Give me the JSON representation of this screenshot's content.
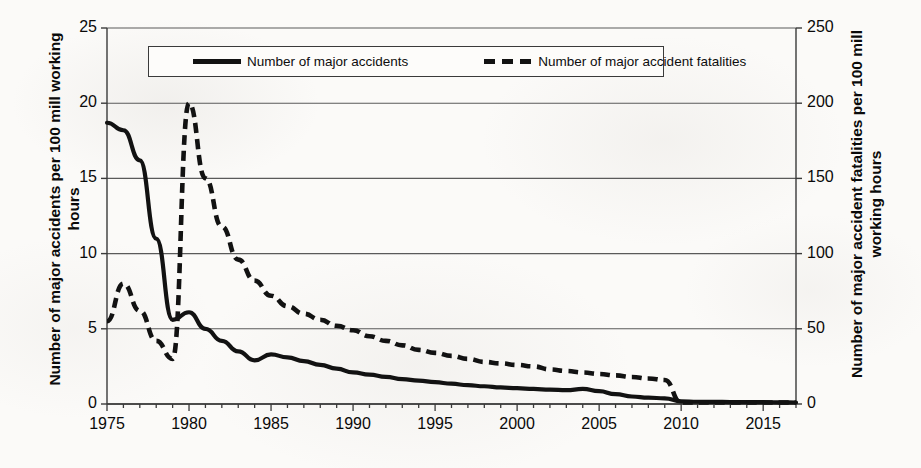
{
  "chart_data": {
    "type": "line",
    "title": "",
    "xlabel": "",
    "ylabel": "Number of major accidents per 100 mill working hours",
    "ylabel_right": "Number of major accident fatalities per 100 mill working hours",
    "xlim": [
      1975,
      2017
    ],
    "ylim": [
      0,
      25
    ],
    "ylim_right": [
      0,
      250
    ],
    "grid": true,
    "legend_position": "top-center",
    "x_ticks": [
      1975,
      1980,
      1985,
      1990,
      1995,
      2000,
      2005,
      2010,
      2015
    ],
    "x_tick_labels": [
      "1975",
      "1980",
      "1985",
      "1990",
      "1995",
      "2000",
      "2005",
      "2010",
      "2015"
    ],
    "x_minor_tick_step": 1,
    "y_ticks_left": [
      0,
      5,
      10,
      15,
      20,
      25
    ],
    "y_tick_labels_left": [
      "0",
      "5",
      "10",
      "15",
      "20",
      "25"
    ],
    "y_ticks_right": [
      0,
      50,
      100,
      150,
      200,
      250
    ],
    "y_tick_labels_right": [
      "0",
      "50",
      "100",
      "150",
      "200",
      "250"
    ],
    "x": [
      1975,
      1976,
      1977,
      1978,
      1979,
      1980,
      1981,
      1982,
      1983,
      1984,
      1985,
      1986,
      1987,
      1988,
      1989,
      1990,
      1991,
      1992,
      1993,
      1994,
      1995,
      1996,
      1997,
      1998,
      1999,
      2000,
      2001,
      2002,
      2003,
      2004,
      2005,
      2006,
      2007,
      2008,
      2009,
      2010,
      2011,
      2012,
      2013,
      2014,
      2015,
      2016,
      2017
    ],
    "series": [
      {
        "name": "Number of major accidents",
        "axis": "left",
        "style": "solid",
        "color": "#121212",
        "values": [
          18.7,
          18.2,
          16.2,
          11.0,
          5.6,
          6.1,
          5.0,
          4.2,
          3.5,
          2.9,
          3.3,
          3.1,
          2.85,
          2.6,
          2.35,
          2.1,
          1.95,
          1.8,
          1.65,
          1.55,
          1.45,
          1.35,
          1.25,
          1.18,
          1.1,
          1.05,
          1.0,
          0.95,
          0.92,
          1.0,
          0.85,
          0.65,
          0.5,
          0.42,
          0.38,
          0.18,
          0.15,
          0.14,
          0.13,
          0.12,
          0.12,
          0.11,
          0.1
        ]
      },
      {
        "name": "Number of major accident fatalities",
        "axis": "right",
        "style": "dashed",
        "color": "#121212",
        "values": [
          55,
          80,
          62,
          42,
          30,
          200,
          150,
          118,
          96,
          82,
          72,
          65,
          60,
          56,
          52,
          49,
          45,
          42,
          39,
          36,
          34,
          32,
          30,
          28,
          27,
          26,
          25,
          23,
          22,
          21,
          20,
          19,
          18,
          17,
          16,
          1,
          1,
          1,
          1,
          1,
          1,
          1,
          1
        ]
      }
    ]
  },
  "legend": {
    "entries": [
      {
        "label": "Number of major accidents",
        "style": "solid"
      },
      {
        "label": "Number of major accident fatalities",
        "style": "dashed"
      }
    ]
  },
  "colors": {
    "line": "#121212",
    "grid": "#5a5a5a",
    "axis": "#3a3a3a",
    "background": "#fbfaf8",
    "text": "#0a0a0a"
  }
}
